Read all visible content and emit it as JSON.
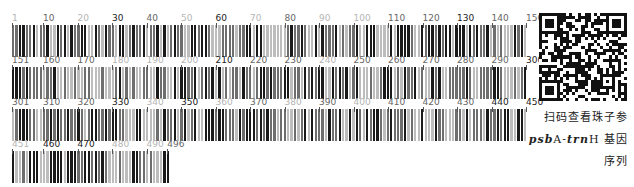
{
  "rows": [
    {
      "start": 1,
      "end": 150,
      "labels": [
        {
          "text": "1",
          "pos": 1,
          "shade": "light"
        },
        {
          "text": "10",
          "pos": 10,
          "shade": "mid"
        },
        {
          "text": "20",
          "pos": 20,
          "shade": "light"
        },
        {
          "text": "30",
          "pos": 30,
          "shade": "dark"
        },
        {
          "text": "40",
          "pos": 40,
          "shade": "mid"
        },
        {
          "text": "50",
          "pos": 50,
          "shade": "light"
        },
        {
          "text": "60",
          "pos": 60,
          "shade": "dark"
        },
        {
          "text": "70",
          "pos": 70,
          "shade": "light"
        },
        {
          "text": "80",
          "pos": 80,
          "shade": "mid"
        },
        {
          "text": "90",
          "pos": 90,
          "shade": "light"
        },
        {
          "text": "100",
          "pos": 100,
          "shade": "light"
        },
        {
          "text": "110",
          "pos": 110,
          "shade": "mid"
        },
        {
          "text": "120",
          "pos": 120,
          "shade": "mid"
        },
        {
          "text": "130",
          "pos": 130,
          "shade": "dark"
        },
        {
          "text": "140",
          "pos": 140,
          "shade": "mid"
        },
        {
          "text": "150",
          "pos": 150,
          "shade": "mid"
        }
      ]
    },
    {
      "start": 151,
      "end": 300,
      "labels": [
        {
          "text": "151",
          "pos": 151,
          "shade": "mid"
        },
        {
          "text": "160",
          "pos": 160,
          "shade": "mid"
        },
        {
          "text": "170",
          "pos": 170,
          "shade": "mid"
        },
        {
          "text": "180",
          "pos": 180,
          "shade": "light"
        },
        {
          "text": "190",
          "pos": 190,
          "shade": "light"
        },
        {
          "text": "200",
          "pos": 200,
          "shade": "light"
        },
        {
          "text": "210",
          "pos": 210,
          "shade": "dark"
        },
        {
          "text": "220",
          "pos": 220,
          "shade": "mid"
        },
        {
          "text": "230",
          "pos": 230,
          "shade": "mid"
        },
        {
          "text": "240",
          "pos": 240,
          "shade": "light"
        },
        {
          "text": "250",
          "pos": 250,
          "shade": "mid"
        },
        {
          "text": "260",
          "pos": 260,
          "shade": "mid"
        },
        {
          "text": "270",
          "pos": 270,
          "shade": "mid"
        },
        {
          "text": "280",
          "pos": 280,
          "shade": "mid"
        },
        {
          "text": "290",
          "pos": 290,
          "shade": "mid"
        },
        {
          "text": "300",
          "pos": 300,
          "shade": "dark"
        }
      ]
    },
    {
      "start": 301,
      "end": 450,
      "labels": [
        {
          "text": "301",
          "pos": 301,
          "shade": "mid"
        },
        {
          "text": "310",
          "pos": 310,
          "shade": "mid"
        },
        {
          "text": "320",
          "pos": 320,
          "shade": "mid"
        },
        {
          "text": "330",
          "pos": 330,
          "shade": "dark"
        },
        {
          "text": "340",
          "pos": 340,
          "shade": "light"
        },
        {
          "text": "350",
          "pos": 350,
          "shade": "dark"
        },
        {
          "text": "360",
          "pos": 360,
          "shade": "light"
        },
        {
          "text": "370",
          "pos": 370,
          "shade": "mid"
        },
        {
          "text": "380",
          "pos": 380,
          "shade": "light"
        },
        {
          "text": "390",
          "pos": 390,
          "shade": "mid"
        },
        {
          "text": "400",
          "pos": 400,
          "shade": "light"
        },
        {
          "text": "410",
          "pos": 410,
          "shade": "mid"
        },
        {
          "text": "420",
          "pos": 420,
          "shade": "mid"
        },
        {
          "text": "430",
          "pos": 430,
          "shade": "mid"
        },
        {
          "text": "440",
          "pos": 440,
          "shade": "dark"
        },
        {
          "text": "450",
          "pos": 450,
          "shade": "dark"
        }
      ]
    },
    {
      "start": 451,
      "end": 496,
      "labels": [
        {
          "text": "451",
          "pos": 451,
          "shade": "light"
        },
        {
          "text": "460",
          "pos": 460,
          "shade": "dark"
        },
        {
          "text": "470",
          "pos": 470,
          "shade": "dark"
        },
        {
          "text": "480",
          "pos": 480,
          "shade": "light"
        },
        {
          "text": "490",
          "pos": 490,
          "shade": "light"
        },
        {
          "text": "496",
          "pos": 496,
          "shade": "mid"
        }
      ]
    }
  ],
  "colors": {
    "dark": "#1a1a1a",
    "mid": "#6e6e6e",
    "light": "#bdbdbd",
    "label_dark": "#222222",
    "label_mid": "#666666",
    "label_light": "#b5b5b5"
  },
  "caption": {
    "line1": "扫码查看珠子参",
    "gene_italic_1": "psb",
    "gene_mid": "A-",
    "gene_italic_2": "trn",
    "gene_end": "H",
    "line2_suffix": "基因",
    "line3": "序列"
  },
  "qr": {
    "icon": "qr-code-icon"
  }
}
